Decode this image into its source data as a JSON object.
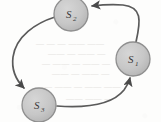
{
  "diagram": {
    "type": "directed-cycle-graph",
    "background_color": "#fdfdfc",
    "node_fill": "#c8c8c8",
    "node_stroke": "#8f8f8f",
    "edge_color": "#5a5a5a",
    "label_color": "#3a3a3a",
    "nodes": [
      {
        "id": "S1",
        "base": "S",
        "subscript": "1",
        "cx": 133,
        "cy": 59,
        "r": 17
      },
      {
        "id": "S2",
        "base": "S",
        "subscript": "2",
        "cx": 71,
        "cy": 14,
        "r": 17
      },
      {
        "id": "S3",
        "base": "S",
        "subscript": "3",
        "cx": 39,
        "cy": 105,
        "r": 17
      }
    ],
    "edges": [
      {
        "id": "e-s1-s2",
        "from": "S1",
        "to": "S2",
        "arrow_direction": "left",
        "shape": "arc-over-top-right"
      },
      {
        "id": "e-s2-s3",
        "from": "S2",
        "to": "S3",
        "arrow_direction": "down",
        "shape": "arc-around-left"
      },
      {
        "id": "e-s3-s1",
        "from": "S3",
        "to": "S1",
        "arrow_direction": "up-left",
        "shape": "arc-under-bottom-right"
      }
    ],
    "background_artifact": {
      "kind": "scan-bleed-through",
      "legible": false,
      "description": "faint reversed text showing through from the back of the page"
    }
  }
}
